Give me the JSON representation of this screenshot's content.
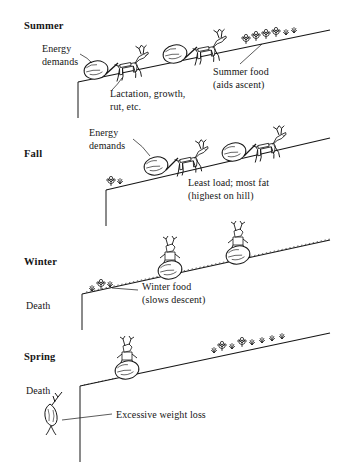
{
  "figure": {
    "type": "conceptual-diagram",
    "background_color": "#ffffff",
    "ink_color": "#161616"
  },
  "panels": [
    {
      "id": "summer",
      "season_label": "Summer",
      "season_pos": {
        "x": 24,
        "y": 20
      },
      "annotations": [
        {
          "name": "energy-demands",
          "lines": [
            "Energy",
            "demands"
          ],
          "x": 42,
          "y": 44
        },
        {
          "name": "lactation-growth-rut",
          "lines": [
            "Lactation, growth,",
            "rut, etc."
          ],
          "x": 110,
          "y": 89
        },
        {
          "name": "summer-food",
          "lines": [
            "Summer food",
            "(aids ascent)"
          ],
          "x": 214,
          "y": 67
        }
      ],
      "creatures": 2,
      "loads": 2,
      "vegetation": "abundant"
    },
    {
      "id": "fall",
      "season_label": "Fall",
      "season_pos": {
        "x": 24,
        "y": 148
      },
      "annotations": [
        {
          "name": "energy-demands",
          "lines": [
            "Energy",
            "demands"
          ],
          "x": 89,
          "y": 128
        },
        {
          "name": "least-load-most-fat",
          "lines": [
            "Least load; most fat",
            "(highest on hill)"
          ],
          "x": 189,
          "y": 178
        }
      ],
      "creatures": 2,
      "loads": 2,
      "vegetation": "sparse"
    },
    {
      "id": "winter",
      "season_label": "Winter",
      "season_pos": {
        "x": 24,
        "y": 256
      },
      "annotations": [
        {
          "name": "winter-food",
          "lines": [
            "Winter food",
            "(slows descent)"
          ],
          "x": 143,
          "y": 282
        },
        {
          "name": "death",
          "lines": [
            "Death"
          ],
          "x": 26,
          "y": 300,
          "style": "death"
        }
      ],
      "creatures": 2,
      "loads": 2,
      "vegetation": "very sparse"
    },
    {
      "id": "spring",
      "season_label": "Spring",
      "season_pos": {
        "x": 24,
        "y": 351
      },
      "annotations": [
        {
          "name": "death",
          "lines": [
            "Death"
          ],
          "x": 26,
          "y": 385,
          "style": "death"
        },
        {
          "name": "excessive-weight-loss",
          "lines": [
            "Excessive weight loss"
          ],
          "x": 116,
          "y": 410
        }
      ],
      "creatures": 1,
      "loads": 1,
      "vegetation": "new growth"
    }
  ]
}
